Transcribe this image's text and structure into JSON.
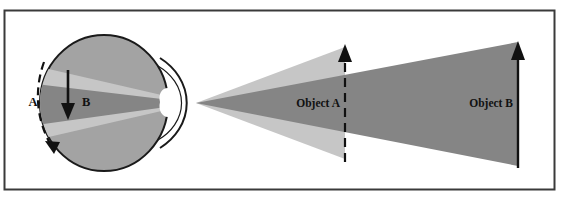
{
  "figure": {
    "type": "optics-ray-diagram",
    "border": {
      "name": "figure-frame",
      "color": "#3a3a3a",
      "x": 4,
      "y": 10,
      "width": 551,
      "height": 180
    },
    "colors": {
      "background": "#ffffff",
      "eyeball_fill": "#a3a3a3",
      "eyeball_outline": "#1a1a1a",
      "lens_fill": "#ffffff",
      "light_cone_near": "#c6c6c6",
      "light_cone_far": "#858585",
      "arrow_stroke": "#111111",
      "text": "#111111"
    },
    "labels": {
      "a": "A",
      "b": "B",
      "object_a": "Object A",
      "object_b": "Object B"
    },
    "annotations": [
      {
        "id": "arrow-a",
        "label": "A",
        "style": "dashed-curved-arrow",
        "description": "dashed curved arrow outside the eye pointing downward"
      },
      {
        "id": "arrow-b",
        "label": "B",
        "style": "solid-straight-arrow",
        "description": "solid straight arrow inside the eye pointing downward"
      },
      {
        "id": "object-a",
        "label": "Object A",
        "style": "dashed-vertical-arrow",
        "description": "nearer object drawn as a dashed vertical line with upward arrowhead"
      },
      {
        "id": "object-b",
        "label": "Object B",
        "style": "solid-vertical-arrow",
        "description": "farther object drawn as a solid vertical line with upward arrowhead"
      }
    ],
    "geometry": {
      "eye_center_x": 104,
      "eye_center_y": 103,
      "eye_radius_x": 64,
      "eye_radius_y": 68,
      "nodal_point_x": 196,
      "nodal_point_y": 103,
      "object_a_x": 345,
      "object_b_x": 518
    }
  }
}
